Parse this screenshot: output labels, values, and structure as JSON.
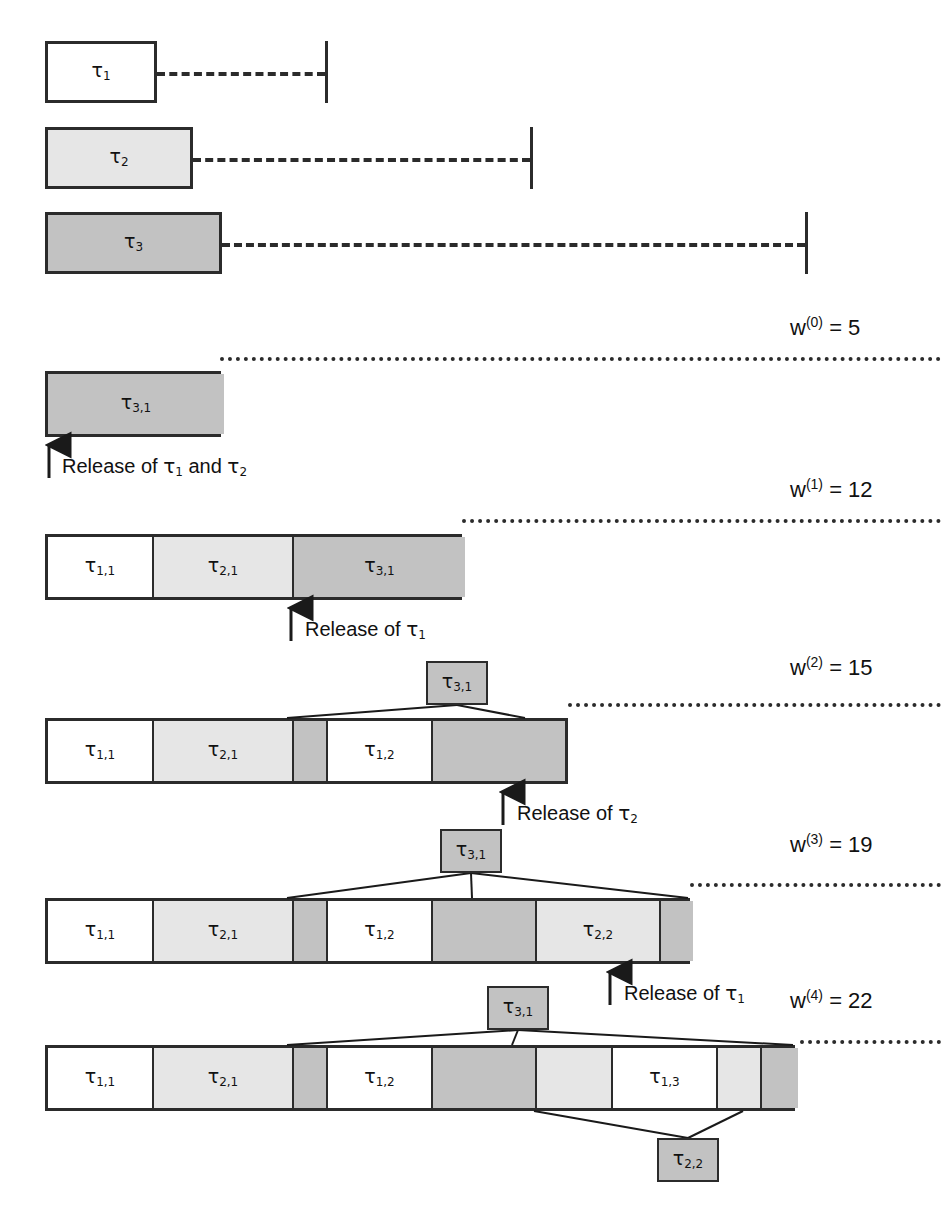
{
  "figure": {
    "kind": "response-time-analysis-iteration-diagram",
    "tau_symbol": "τ"
  },
  "task_declarations": [
    {
      "name": "task-bar-tau1",
      "label": "τ",
      "sub": "1",
      "fill": "white",
      "x": 45,
      "y": 41,
      "w": 112,
      "h": 62,
      "dash_from": 157,
      "dash_to": 325,
      "deadline_x": 325,
      "deadline_y": 41,
      "deadline_h": 62
    },
    {
      "name": "task-bar-tau2",
      "label": "τ",
      "sub": "2",
      "fill": "light",
      "x": 45,
      "y": 127,
      "w": 148,
      "h": 62,
      "dash_from": 193,
      "dash_to": 530,
      "deadline_x": 530,
      "deadline_y": 127,
      "deadline_h": 62
    },
    {
      "name": "task-bar-tau3",
      "label": "τ",
      "sub": "3",
      "fill": "dark",
      "x": 45,
      "y": 212,
      "w": 177,
      "h": 62,
      "dash_from": 222,
      "dash_to": 805,
      "deadline_x": 805,
      "deadline_y": 212,
      "deadline_h": 62
    }
  ],
  "iterations": [
    {
      "name": "iteration-0",
      "w_label": {
        "prefix": "w",
        "sup": "(0)",
        "eq": " = ",
        "value": "5"
      },
      "w_label_x": 790,
      "w_label_y": 315,
      "dot_y": 357,
      "dot_from": 220,
      "dot_to": 941,
      "row": {
        "x": 45,
        "y": 371,
        "w": 176,
        "h": 66
      },
      "segments": [
        {
          "label": "τ",
          "sub": "3,1",
          "fill": "dark",
          "width": 176,
          "show_label": true
        }
      ],
      "release": {
        "text_prefix": "Release of ",
        "parts": [
          {
            "t": "τ",
            "s": "1"
          },
          {
            "plain": " and "
          },
          {
            "t": "τ",
            "s": "2"
          }
        ],
        "arrow_x": 49,
        "arrow_top": 441,
        "arrow_bottom": 478,
        "text_x": 62,
        "text_y": 454
      }
    },
    {
      "name": "iteration-1",
      "w_label": {
        "prefix": "w",
        "sup": "(1)",
        "eq": " = ",
        "value": "12"
      },
      "w_label_x": 790,
      "w_label_y": 477,
      "dot_y": 519,
      "dot_from": 462,
      "dot_to": 941,
      "row": {
        "x": 45,
        "y": 534,
        "w": 417,
        "h": 66
      },
      "segments": [
        {
          "label": "τ",
          "sub": "1,1",
          "fill": "white",
          "width": 106,
          "show_label": true
        },
        {
          "label": "τ",
          "sub": "2,1",
          "fill": "light",
          "width": 140,
          "show_label": true
        },
        {
          "label": "τ",
          "sub": "3,1",
          "fill": "dark",
          "width": 171,
          "show_label": true
        }
      ],
      "release": {
        "text_prefix": "Release of ",
        "parts": [
          {
            "t": "τ",
            "s": "1"
          }
        ],
        "arrow_x": 291,
        "arrow_top": 604,
        "arrow_bottom": 641,
        "text_x": 305,
        "text_y": 617
      }
    },
    {
      "name": "iteration-2",
      "w_label": {
        "prefix": "w",
        "sup": "(2)",
        "eq": " = ",
        "value": "15"
      },
      "w_label_x": 790,
      "w_label_y": 655,
      "dot_y": 703,
      "dot_from": 568,
      "dot_to": 941,
      "row": {
        "x": 45,
        "y": 718,
        "w": 523,
        "h": 66
      },
      "segments": [
        {
          "label": "τ",
          "sub": "1,1",
          "fill": "white",
          "width": 106,
          "show_label": true
        },
        {
          "label": "τ",
          "sub": "2,1",
          "fill": "light",
          "width": 140,
          "show_label": true
        },
        {
          "label": "",
          "sub": "",
          "fill": "dark",
          "width": 34,
          "show_label": false
        },
        {
          "label": "τ",
          "sub": "1,2",
          "fill": "white",
          "width": 105,
          "show_label": true
        },
        {
          "label": "",
          "sub": "",
          "fill": "dark",
          "width": 132,
          "show_label": false
        }
      ],
      "callout": {
        "label": "τ",
        "sub": "3,1",
        "fill": "dark",
        "x": 426,
        "y": 661,
        "w": 62,
        "h": 44,
        "connect_to": [
          {
            "x": 287,
            "y": 718
          },
          {
            "x": 525,
            "y": 718
          }
        ]
      },
      "release": {
        "text_prefix": "Release of ",
        "parts": [
          {
            "t": "τ",
            "s": "2"
          }
        ],
        "arrow_x": 503,
        "arrow_top": 788,
        "arrow_bottom": 825,
        "text_x": 517,
        "text_y": 801
      }
    },
    {
      "name": "iteration-3",
      "w_label": {
        "prefix": "w",
        "sup": "(3)",
        "eq": " = ",
        "value": "19"
      },
      "w_label_x": 790,
      "w_label_y": 832,
      "dot_y": 883,
      "dot_from": 690,
      "dot_to": 941,
      "row": {
        "x": 45,
        "y": 898,
        "w": 645,
        "h": 66
      },
      "segments": [
        {
          "label": "τ",
          "sub": "1,1",
          "fill": "white",
          "width": 106,
          "show_label": true
        },
        {
          "label": "τ",
          "sub": "2,1",
          "fill": "light",
          "width": 140,
          "show_label": true
        },
        {
          "label": "",
          "sub": "",
          "fill": "dark",
          "width": 34,
          "show_label": false
        },
        {
          "label": "τ",
          "sub": "1,2",
          "fill": "white",
          "width": 105,
          "show_label": true
        },
        {
          "label": "",
          "sub": "",
          "fill": "dark",
          "width": 104,
          "show_label": false
        },
        {
          "label": "τ",
          "sub": "2,2",
          "fill": "light",
          "width": 124,
          "show_label": true
        },
        {
          "label": "",
          "sub": "",
          "fill": "dark",
          "width": 32,
          "show_label": false
        }
      ],
      "callout": {
        "label": "τ",
        "sub": "3,1",
        "fill": "dark",
        "x": 440,
        "y": 829,
        "w": 62,
        "h": 44,
        "connect_to": [
          {
            "x": 287,
            "y": 898
          },
          {
            "x": 472,
            "y": 898
          },
          {
            "x": 688,
            "y": 898
          }
        ]
      },
      "release": {
        "text_prefix": "Release of ",
        "parts": [
          {
            "t": "τ",
            "s": "1"
          }
        ],
        "arrow_x": 610,
        "arrow_top": 968,
        "arrow_bottom": 1005,
        "text_x": 624,
        "text_y": 981
      }
    },
    {
      "name": "iteration-4",
      "w_label": {
        "prefix": "w",
        "sup": "(4)",
        "eq": " = ",
        "value": "22"
      },
      "w_label_x": 790,
      "w_label_y": 988,
      "dot_y": 1040,
      "dot_from": 800,
      "dot_to": 941,
      "row": {
        "x": 45,
        "y": 1045,
        "w": 750,
        "h": 66
      },
      "segments": [
        {
          "label": "τ",
          "sub": "1,1",
          "fill": "white",
          "width": 106,
          "show_label": true
        },
        {
          "label": "τ",
          "sub": "2,1",
          "fill": "light",
          "width": 140,
          "show_label": true
        },
        {
          "label": "",
          "sub": "",
          "fill": "dark",
          "width": 34,
          "show_label": false
        },
        {
          "label": "τ",
          "sub": "1,2",
          "fill": "white",
          "width": 105,
          "show_label": true
        },
        {
          "label": "",
          "sub": "",
          "fill": "dark",
          "width": 104,
          "show_label": false
        },
        {
          "label": "",
          "sub": "",
          "fill": "light",
          "width": 76,
          "show_label": false
        },
        {
          "label": "τ",
          "sub": "1,3",
          "fill": "white",
          "width": 105,
          "show_label": true
        },
        {
          "label": "",
          "sub": "",
          "fill": "light",
          "width": 44,
          "show_label": false
        },
        {
          "label": "",
          "sub": "",
          "fill": "dark",
          "width": 36,
          "show_label": false
        }
      ],
      "callout": {
        "label": "τ",
        "sub": "3,1",
        "fill": "dark",
        "x": 487,
        "y": 986,
        "w": 62,
        "h": 44,
        "connect_to": [
          {
            "x": 287,
            "y": 1045
          },
          {
            "x": 512,
            "y": 1045
          },
          {
            "x": 793,
            "y": 1045
          }
        ]
      },
      "callout_below": {
        "label": "τ",
        "sub": "2,2",
        "fill": "white",
        "x": 657,
        "y": 1138,
        "w": 62,
        "h": 44,
        "connect_to": [
          {
            "x": 534,
            "y": 1111
          },
          {
            "x": 743,
            "y": 1111
          }
        ]
      }
    }
  ]
}
